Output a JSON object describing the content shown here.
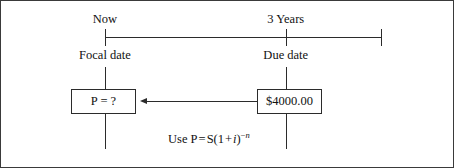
{
  "diagram": {
    "type": "timeline-present-value",
    "timeline": {
      "top_labels": [
        {
          "text": "Now",
          "x_pct": 23
        },
        {
          "text": "3 Years",
          "x_pct": 63
        }
      ],
      "bottom_labels": [
        {
          "text": "Focal date",
          "x_pct": 23
        },
        {
          "text": "Due date",
          "x_pct": 63
        }
      ],
      "ticks": [
        {
          "name": "now-tick",
          "x_pct": 23
        },
        {
          "name": "due-date-tick",
          "x_pct": 63
        },
        {
          "name": "end-tick",
          "x_pct": 84
        }
      ]
    },
    "boxes": [
      {
        "name": "present-value-box",
        "text": "P = ?",
        "x_pct": 23
      },
      {
        "name": "future-value-box",
        "text": "$4000.00",
        "x_pct": 63
      }
    ],
    "arrow": {
      "name": "discount-arrow",
      "direction": "left",
      "from": "future-value-box",
      "to": "present-value-box"
    },
    "formula": {
      "prefix": "Use P",
      "equals": "=",
      "base_open": "S(1",
      "plus": "+",
      "rate": "i",
      "base_close": ")",
      "exponent_sign": "−",
      "exponent_symbol": "n",
      "full_text": "Use P = S(1 + i)−n"
    }
  }
}
